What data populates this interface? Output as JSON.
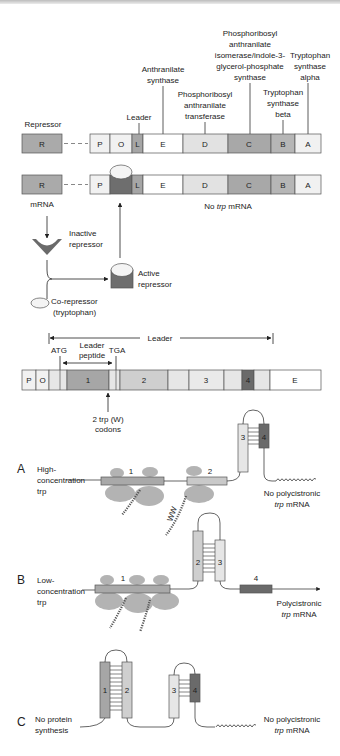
{
  "colors": {
    "repressor": "#aaaaaa",
    "light": "#ececec",
    "white": "#ffffff",
    "d_gene": "#e2e2e2",
    "c_gene": "#a8a8a8",
    "b_gene": "#b6b6b6",
    "leader_l": "#a6a6a6",
    "active_repressor_body": "#6e6e6e",
    "ribosome": "#b3b3b3",
    "region1": "#a6a6a6",
    "region2": "#cfcfcf",
    "region3": "#e6e6e6",
    "region4": "#6a6a6a",
    "outline": "#555555"
  },
  "operon_gene_labels": {
    "leader": "Leader",
    "anthranilate_synthase": [
      "Anthranilate",
      "synthase"
    ],
    "phosphoribosyl_transferase": [
      "Phosphoribosyl",
      "anthranilate",
      "transferase"
    ],
    "isomerase": [
      "Phosphoribosyl",
      "anthranilate",
      "isomerase/indole-3-",
      "glycerol-phosphate",
      "synthase"
    ],
    "tryptophan_synthase_beta": [
      "Tryptophan",
      "synthase",
      "beta"
    ],
    "tryptophan_synthase_alpha": [
      "Tryptophan",
      "synthase",
      "alpha"
    ],
    "repressor": "Repressor"
  },
  "operon_row1": {
    "repressor_gene": "R",
    "segments": [
      "P",
      "O",
      "L",
      "E",
      "D",
      "C",
      "B",
      "A"
    ]
  },
  "operon_row2": {
    "repressor_gene": "R",
    "segments": [
      "P",
      "L",
      "E",
      "D",
      "C",
      "B",
      "A"
    ],
    "mrna_label": "mRNA",
    "no_mrna_label_prefix": "No ",
    "no_mrna_label_italic": "trp",
    "no_mrna_label_suffix": " mRNA"
  },
  "regulation": {
    "inactive_repressor": [
      "Inactive",
      "repressor"
    ],
    "active_repressor": [
      "Active",
      "repressor"
    ],
    "co_repressor": [
      "Co-repressor",
      "(tryptophan)"
    ]
  },
  "leader_map": {
    "leader_label": "Leader",
    "atg": "ATG",
    "leader_peptide": [
      "Leader",
      "peptide"
    ],
    "tga": "TGA",
    "segments": [
      "P",
      "O",
      "1",
      "2",
      "3",
      "4",
      "E"
    ],
    "trp_codons": [
      "2 trp (W)",
      "codons"
    ]
  },
  "panel_a": {
    "letter": "A",
    "condition": [
      "High-",
      "concentration",
      "trp"
    ],
    "ribosome_labels": [
      "1",
      "2"
    ],
    "hairpin_labels": [
      "3",
      "4"
    ],
    "peptide_label": "WW",
    "result": [
      "No polycistronic",
      "trp mRNA"
    ]
  },
  "panel_b": {
    "letter": "B",
    "condition": [
      "Low-",
      "concentration",
      "trp"
    ],
    "ribosome_label": "1",
    "hairpin_labels": [
      "2",
      "3"
    ],
    "region4_label": "4",
    "result": [
      "Polycistronic",
      "trp mRNA"
    ]
  },
  "panel_c": {
    "letter": "C",
    "condition": [
      "No protein",
      "synthesis"
    ],
    "hairpin1_labels": [
      "1",
      "2"
    ],
    "hairpin2_labels": [
      "3",
      "4"
    ],
    "result": [
      "No polycistronic",
      "trp mRNA"
    ]
  }
}
